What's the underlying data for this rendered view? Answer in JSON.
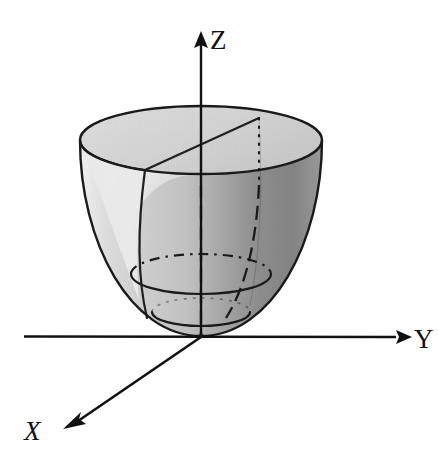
{
  "figure": {
    "background_color": "#ffffff",
    "width": 438,
    "height": 456
  },
  "axes": {
    "stroke_color": "#111111",
    "items": [
      {
        "name": "z-axis",
        "label": "Z",
        "label_style": "upright-serif",
        "label_x": 210,
        "label_y": 48,
        "direction": "up",
        "origin_x": 201,
        "origin_y": 337,
        "tip_x": 201,
        "tip_y": 32
      },
      {
        "name": "y-axis",
        "label": "Y",
        "label_style": "upright-serif",
        "label_x": 414,
        "label_y": 348,
        "direction": "right",
        "origin_x": 24,
        "origin_y": 336,
        "tip_x": 408,
        "tip_y": 337
      },
      {
        "name": "x-axis",
        "label": "X",
        "label_style": "italic-serif",
        "label_x": 25,
        "label_y": 440,
        "direction": "down-left",
        "origin_x": 201,
        "origin_y": 337,
        "tip_x": 64,
        "tip_y": 429
      }
    ]
  },
  "surface": {
    "name": "paraboloid",
    "outline_color": "#1a1a1a",
    "top_rim": {
      "center_x": 201,
      "center_y": 140,
      "rx": 121,
      "ry": 34
    },
    "vertex": {
      "x": 201,
      "y": 336
    },
    "fill_outer_light": "#dcdcdc",
    "fill_outer_dark": "#8a8a8a",
    "fill_inner_light": "#ececec",
    "fill_rim_top": "#d8d8d8",
    "shading_note": "halftone gray, light on left, dark on right"
  },
  "guide_lines": [
    {
      "name": "top-chord",
      "style": "solid",
      "description": "chord across top rim from left-front edge to upper-right rim"
    },
    {
      "name": "hidden-z-axis-segment",
      "style": "dashed",
      "description": "vertical dashed line inside the bowl along the Z axis"
    },
    {
      "name": "hidden-generator",
      "style": "dash-dot",
      "description": "vertical dash-dot line from right rim point down to vertex"
    },
    {
      "name": "front-generator",
      "style": "solid",
      "description": "solid meridian curve on the front-left of the bowl"
    },
    {
      "name": "lower-cross-section-hidden",
      "style": "dash-dot",
      "description": "dash-dot ellipse arc, rear half of lower cross-section"
    },
    {
      "name": "lower-cross-section-visible",
      "style": "solid",
      "description": "solid ellipse arc, front half of lower cross-section"
    },
    {
      "name": "bottom-cross-section",
      "style": "solid",
      "description": "solid ellipse arc near the vertex"
    }
  ]
}
